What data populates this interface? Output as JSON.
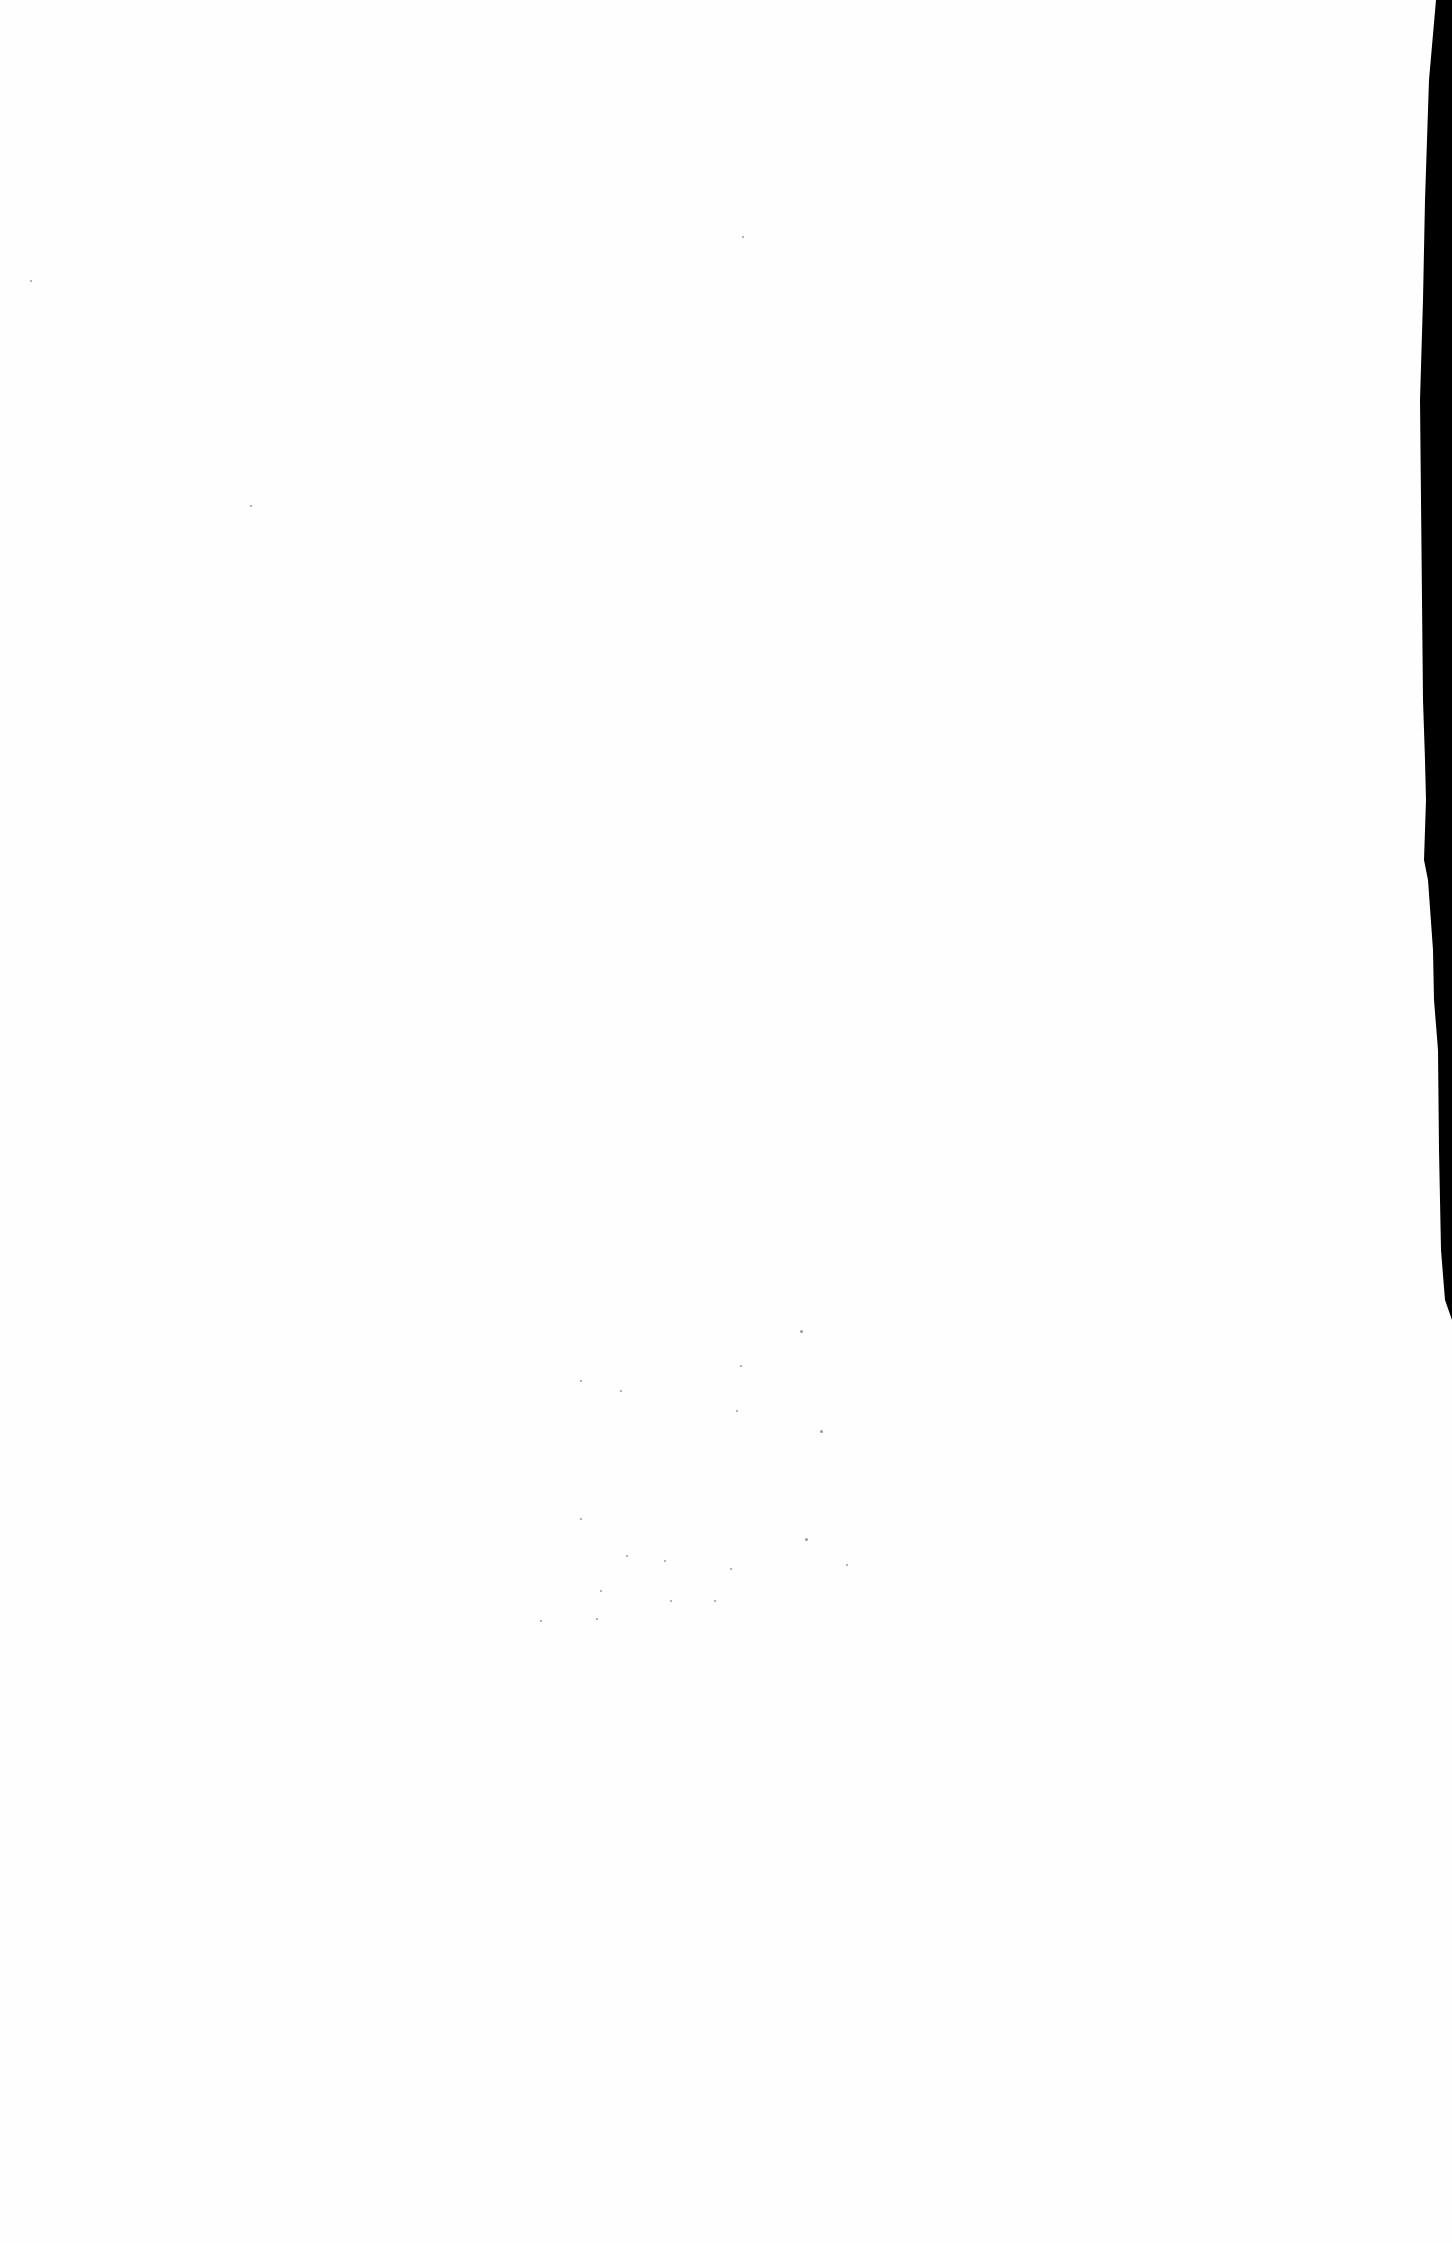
{
  "page": {
    "type": "blank scanned page",
    "text": "",
    "colors": {
      "paper": "#fefefe",
      "edge_shadow": "#000000",
      "noise": "#9a9a9a"
    }
  }
}
